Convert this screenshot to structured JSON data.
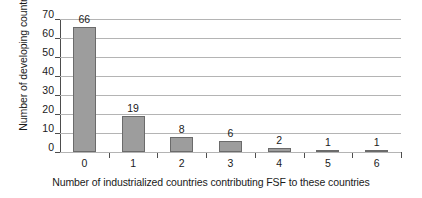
{
  "chart_data": {
    "type": "bar",
    "title": "",
    "categories": [
      "0",
      "1",
      "2",
      "3",
      "4",
      "5",
      "6"
    ],
    "values": [
      66,
      19,
      8,
      6,
      2,
      1,
      1
    ],
    "data_labels": [
      "66",
      "19",
      "8",
      "6",
      "2",
      "1",
      "1"
    ],
    "xlabel": "Number of industrialized countries contributing FSF to these countries",
    "ylabel": "Number of developing countries",
    "ylim": [
      0,
      70
    ],
    "ytick_step": 10,
    "yticks": [
      "0",
      "10",
      "20",
      "30",
      "40",
      "50",
      "60",
      "70"
    ],
    "grid": "horizontal",
    "legend": "none",
    "bar_fill_color": "#9d9d9d",
    "bar_border_color": "#6b6b6b",
    "gridline_color": "#b4b4b4",
    "axis_color": "#4d4d4d",
    "background_color": "#ffffff"
  }
}
